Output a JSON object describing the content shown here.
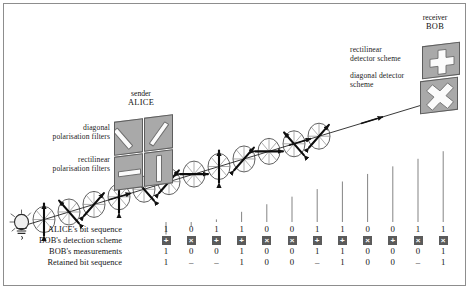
{
  "figure": {
    "kind": "bb84-quantum-key-distribution-diagram",
    "background": "#ffffff",
    "frame_color": "#8d8d8d",
    "tile_color": "#a9a9a9",
    "scheme_box_color": "#5b5b5b"
  },
  "labels": {
    "sender_role": "sender",
    "sender_name": "ALICE",
    "receiver_role": "receiver",
    "receiver_name": "BOB",
    "diagonal_filters": "diagonal\npolarisation filters",
    "rectilinear_filters": "rectilinear\npolarisation filters",
    "rectilinear_detector": "rectilinear\ndetector scheme",
    "diagonal_detector": "diagonal detector\nscheme"
  },
  "table": {
    "rows": [
      {
        "label": "ALICE's bit sequence",
        "type": "text",
        "values": [
          "1",
          "0",
          "1",
          "1",
          "0",
          "0",
          "1",
          "1",
          "0",
          "0",
          "1",
          "1"
        ]
      },
      {
        "label": "BOB's detection scheme",
        "type": "scheme",
        "values": [
          "+",
          "×",
          "+",
          "+",
          "×",
          "×",
          "+",
          "+",
          "×",
          "+",
          "×",
          "×"
        ]
      },
      {
        "label": "BOB's measurements",
        "type": "text",
        "values": [
          "1",
          "0",
          "0",
          "1",
          "0",
          "0",
          "1",
          "1",
          "0",
          "0",
          "0",
          "1"
        ]
      },
      {
        "label": "Retained bit sequence",
        "type": "text",
        "values": [
          "1",
          "–",
          "–",
          "1",
          "0",
          "0",
          "–",
          "1",
          "0",
          "0",
          "–",
          "1"
        ]
      }
    ]
  },
  "alice_panel": {
    "tiles": [
      {
        "name": "filter-diagonal-backslash",
        "slit": "backslash"
      },
      {
        "name": "filter-diagonal-slash",
        "slit": "slash"
      },
      {
        "name": "filter-rectilinear-horizontal",
        "slit": "horizontal"
      },
      {
        "name": "filter-rectilinear-vertical",
        "slit": "vertical"
      }
    ]
  },
  "bob_panel": {
    "tiles": [
      {
        "name": "detector-rectilinear",
        "glyph": "+"
      },
      {
        "name": "detector-diagonal",
        "glyph": "×"
      }
    ]
  },
  "photons": {
    "count": 12,
    "polarisation_angles_deg": [
      90,
      135,
      45,
      90,
      135,
      45,
      0,
      90,
      45,
      0,
      135,
      45
    ]
  },
  "source": {
    "name": "light-bulb"
  }
}
